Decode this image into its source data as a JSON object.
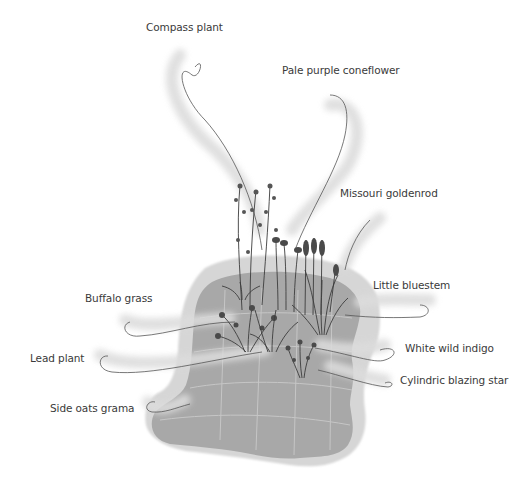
{
  "diagram": {
    "type": "labeled-illustration",
    "colors": {
      "background": "#ffffff",
      "ground": "#a8a8a8",
      "ground_halo": "#d6d6d6",
      "paving_lines": "#c4c4c4",
      "leader_line": "#555555",
      "leader_glow": "#dcdcdc",
      "plant": "#3c3c3c",
      "label_text": "#3a3a3a"
    },
    "labels": [
      {
        "id": "compass-plant",
        "text": "Compass plant"
      },
      {
        "id": "pale-purple-coneflower",
        "text": "Pale purple coneflower"
      },
      {
        "id": "missouri-goldenrod",
        "text": "Missouri goldenrod"
      },
      {
        "id": "little-bluestem",
        "text": "Little bluestem"
      },
      {
        "id": "buffalo-grass",
        "text": "Buffalo grass"
      },
      {
        "id": "white-wild-indigo",
        "text": "White wild indigo"
      },
      {
        "id": "lead-plant",
        "text": "Lead plant"
      },
      {
        "id": "cylindric-blazing-star",
        "text": "Cylindric blazing star"
      },
      {
        "id": "side-oats-grama",
        "text": "Side oats grama"
      }
    ]
  }
}
